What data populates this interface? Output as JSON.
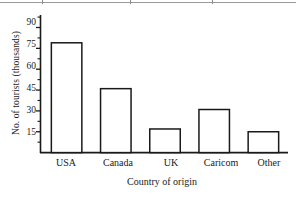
{
  "chart_data": {
    "type": "bar",
    "title": "",
    "xlabel": "Country of origin",
    "ylabel": "No. of tourists (thousands)",
    "categories": [
      "USA",
      "Canada",
      "UK",
      "Caricom",
      "Other"
    ],
    "values": [
      79,
      46,
      17,
      31,
      15
    ],
    "ytick_labels": [
      "15",
      "30",
      "45",
      "60",
      "75",
      "90"
    ],
    "ytick_values": [
      15,
      30,
      45,
      60,
      75,
      90
    ],
    "yminor_values": [
      7.5,
      22.5,
      37.5,
      52.5,
      67.5,
      82.5,
      97.5
    ],
    "ylim": [
      0,
      99
    ],
    "grid": false,
    "legend": null,
    "bar_fill": "#ffffff",
    "bar_edge": "#1a1a1a",
    "axis_color": "#1a1a1a"
  },
  "figure": {
    "caption": ""
  }
}
